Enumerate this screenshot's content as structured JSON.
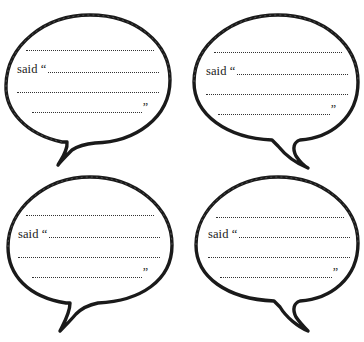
{
  "page": {
    "stroke_color": "#1a1a1a",
    "background": "#ffffff"
  },
  "bubbles": [
    {
      "id": "top-left",
      "lines": [
        "",
        "said “",
        "",
        ""
      ],
      "closing_quote": "”"
    },
    {
      "id": "top-right",
      "lines": [
        "",
        "said “",
        "",
        ""
      ],
      "closing_quote": "”"
    },
    {
      "id": "bottom-left",
      "lines": [
        "",
        "said “",
        "",
        ""
      ],
      "closing_quote": "”"
    },
    {
      "id": "bottom-right",
      "lines": [
        "",
        "said “",
        "",
        ""
      ],
      "closing_quote": "”"
    }
  ]
}
